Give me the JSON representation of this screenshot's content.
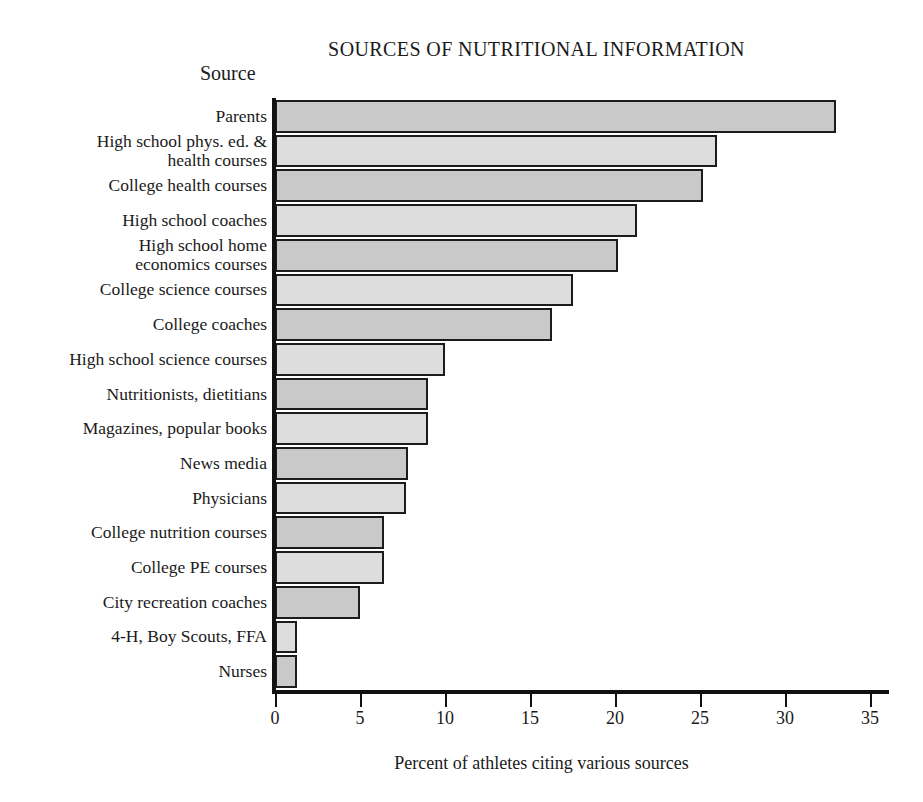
{
  "chart_data": {
    "type": "bar",
    "orientation": "horizontal",
    "title": "SOURCES OF NUTRITIONAL INFORMATION",
    "xlabel": "Percent of athletes citing various sources",
    "ylabel": "Source",
    "xlim": [
      0,
      36
    ],
    "xticks": [
      0,
      5,
      10,
      15,
      20,
      25,
      30,
      35
    ],
    "xtick_labels": [
      "0",
      "5",
      "10",
      "15",
      "20",
      "25",
      "30",
      "35"
    ],
    "grid": false,
    "legend": null,
    "categories": [
      "Parents",
      "High school phys. ed. &\nhealth courses",
      "College health courses",
      "High school coaches",
      "High school home\neconomics courses",
      "College science courses",
      "College coaches",
      "High school science courses",
      "Nutritionists, dietitians",
      "Magazines, popular books",
      "News media",
      "Physicians",
      "College nutrition courses",
      "College PE courses",
      "City recreation coaches",
      "4-H, Boy Scouts, FFA",
      "Nurses"
    ],
    "values": [
      33,
      26,
      25.2,
      21.3,
      20.2,
      17.5,
      16.3,
      10,
      9,
      9,
      7.8,
      7.7,
      6.4,
      6.4,
      5,
      1.3,
      1.3
    ],
    "bar_colors": [
      "#c9c9c9",
      "#dddddd"
    ],
    "bar_border_color": "#1c1c1c"
  }
}
